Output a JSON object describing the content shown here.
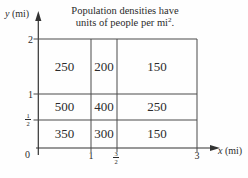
{
  "figure": {
    "caption_line1": "Population densities have",
    "caption_line2_pre": "units of people per mi",
    "caption_line2_sup": "2",
    "caption_line2_post": "."
  },
  "axes": {
    "y_var": "y",
    "y_unit": " (mi)",
    "x_var": "x",
    "x_unit": " (mi)",
    "y_ticks": {
      "t2": "2",
      "t1": "1",
      "half_num": "1",
      "half_den": "2",
      "origin": "0"
    },
    "x_ticks": {
      "t1": "1",
      "three_halves_num": "3",
      "three_halves_den": "2",
      "t3": "3"
    }
  },
  "grid": {
    "unit": "people per mi^2",
    "x_bounds_mi": [
      0,
      1,
      1.5,
      3
    ],
    "y_bounds_mi": [
      0,
      0.5,
      1,
      2
    ],
    "rows": [
      {
        "y_range": "1 to 2",
        "values": [
          "250",
          "200",
          "150"
        ]
      },
      {
        "y_range": "1/2 to 1",
        "values": [
          "500",
          "400",
          "250"
        ]
      },
      {
        "y_range": "0 to 1/2",
        "values": [
          "350",
          "300",
          "150"
        ]
      }
    ]
  },
  "colors": {
    "ink": "#2b2b2b",
    "line": "#4a4a4a",
    "background": "#fefefe"
  }
}
